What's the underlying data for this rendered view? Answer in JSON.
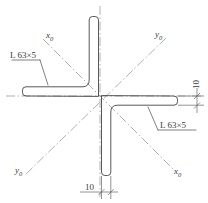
{
  "drawing": {
    "title": "Double angle section composite",
    "profile_label_upper_left": "L 63×5",
    "profile_label_lower_right": "L 63×5",
    "axis_label_upper_left": "x",
    "axis_sub_upper_left": "0",
    "axis_label_upper_right": "y",
    "axis_sub_upper_right": "0",
    "axis_label_lower_left": "y",
    "axis_sub_lower_left": "0",
    "axis_label_lower_right": "x",
    "axis_sub_lower_right": "0",
    "dimension_right": "10",
    "dimension_bottom": "10",
    "colors": {
      "outline": "#3a3a3a",
      "centerline": "#8a8a8a",
      "dimension": "#5a5a5a",
      "background": "#ffffff"
    }
  }
}
